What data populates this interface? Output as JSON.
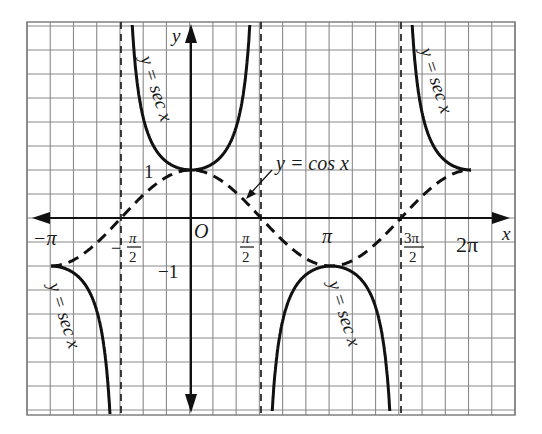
{
  "chart_data": {
    "type": "line",
    "title": "",
    "xlabel": "x",
    "ylabel": "y",
    "origin_label": "O",
    "xlim": [
      -3.6,
      6.9
    ],
    "ylim": [
      -4.1,
      4.1
    ],
    "grid": true,
    "x_ticks": [
      {
        "value": -3.14159,
        "label": "−π"
      },
      {
        "value": -1.5708,
        "label": "−π/2"
      },
      {
        "value": 1.5708,
        "label": "π/2"
      },
      {
        "value": 3.14159,
        "label": "π"
      },
      {
        "value": 4.71239,
        "label": "3π/2"
      },
      {
        "value": 6.28319,
        "label": "2π"
      }
    ],
    "y_ticks": [
      {
        "value": 1,
        "label": "1"
      },
      {
        "value": -1,
        "label": "−1"
      }
    ],
    "asymptotes": [
      -1.5708,
      1.5708,
      4.71239
    ],
    "series": [
      {
        "name": "y = sec x",
        "style": "solid",
        "function": "sec",
        "domain": [
          -3.14159,
          6.28319
        ],
        "labels": [
          "y = sec x",
          "y = sec x",
          "y = sec x",
          "y = sec x"
        ]
      },
      {
        "name": "y = cos x",
        "style": "dashed",
        "function": "cos",
        "domain": [
          -3.14159,
          6.28319
        ],
        "labels": [
          "y = cos x"
        ]
      }
    ],
    "sample_points": {
      "x": [
        -3.14159,
        -1.5708,
        0,
        1.5708,
        3.14159,
        4.71239,
        6.28319
      ],
      "cos": [
        -1,
        0,
        1,
        0,
        -1,
        0,
        1
      ],
      "sec": [
        -1,
        null,
        1,
        null,
        -1,
        null,
        1
      ]
    }
  },
  "labels": {
    "x_axis": "x",
    "y_axis": "y",
    "origin": "O",
    "neg_pi": "−π",
    "neg_half_pi_sign": "−",
    "pi_sym": "π",
    "two": "2",
    "three_pi": "3π",
    "pi": "π",
    "two_pi": "2π",
    "one": "1",
    "neg_one": "−1",
    "cos_label": "y = cos x",
    "sec_label": "y = sec x"
  }
}
